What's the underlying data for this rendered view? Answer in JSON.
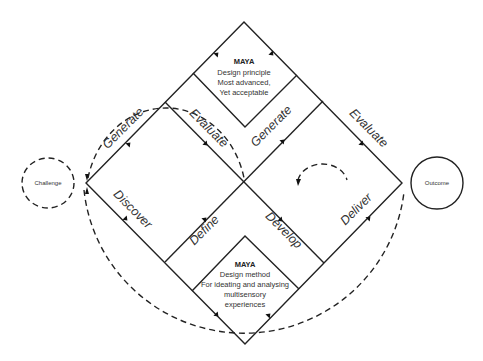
{
  "diagram": {
    "challenge": {
      "label": "Challenge"
    },
    "outcome": {
      "label": "Outcome"
    },
    "phases": {
      "discover": "Discover",
      "define": "Define",
      "develop": "Develop",
      "deliver": "Deliver"
    },
    "activities": {
      "generate_left": "Generate",
      "evaluate_left": "Evaluate",
      "generate_right": "Generate",
      "evaluate_right": "Evaluate"
    },
    "maya_top": {
      "title": "MAYA",
      "lines": [
        "Design principle",
        "Most advanced,",
        "Yet acceptable"
      ]
    },
    "maya_bottom": {
      "title": "MAYA",
      "lines": [
        "Design method",
        "For ideating and analysing",
        "multisensory",
        "experiences"
      ]
    },
    "colors": {
      "stroke": "#222222",
      "background": "#ffffff"
    }
  }
}
